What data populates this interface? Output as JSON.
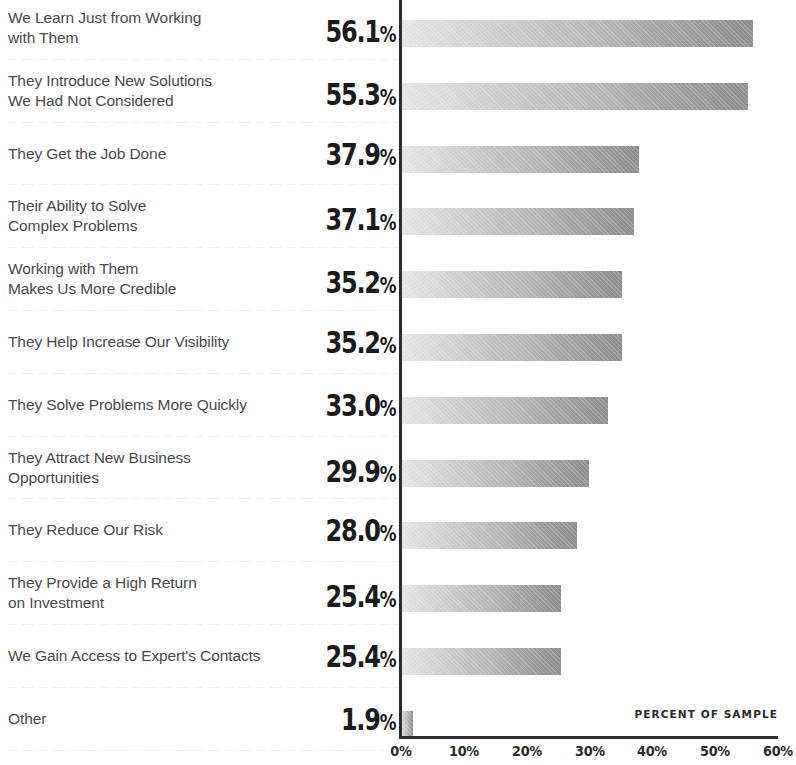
{
  "chart_data": {
    "type": "bar",
    "orientation": "horizontal",
    "title": "",
    "subtitle": "",
    "xlabel": "PERCENT OF SAMPLE",
    "ylabel": "",
    "xlim": [
      0,
      60
    ],
    "xticks": [
      "0%",
      "10%",
      "20%",
      "30%",
      "40%",
      "50%",
      "60%"
    ],
    "xtick_values": [
      0,
      10,
      20,
      30,
      40,
      50,
      60
    ],
    "grid": false,
    "legend": null,
    "categories": [
      "We Learn Just from Working\nwith Them",
      "They Introduce New Solutions\nWe Had Not Considered",
      "They Get the Job Done",
      "Their Ability to Solve\nComplex Problems",
      "Working with Them\nMakes Us More Credible",
      "They Help Increase Our Visibility",
      "They Solve Problems More Quickly",
      "They Attract New Business\nOpportunities",
      "They Reduce Our Risk",
      "They Provide a High Return\non Investment",
      "We Gain Access to Expert's Contacts",
      "Other"
    ],
    "values": [
      56.1,
      55.3,
      37.9,
      37.1,
      35.2,
      35.2,
      33.0,
      29.9,
      28.0,
      25.4,
      25.4,
      1.9
    ],
    "value_labels": [
      "56.1%",
      "55.3%",
      "37.9%",
      "37.1%",
      "35.2%",
      "35.2%",
      "33.0%",
      "29.9%",
      "28.0%",
      "25.4%",
      "25.4%",
      "1.9%"
    ],
    "colors": {
      "bar_gradient_start": "#e6e6e6",
      "bar_gradient_end": "#8e8e8e",
      "axis": "#2b2b2b",
      "category_text": "#4a4a4a",
      "value_text": "#1b1b1b",
      "separator": "#f0f0f0",
      "background": "#ffffff"
    }
  }
}
